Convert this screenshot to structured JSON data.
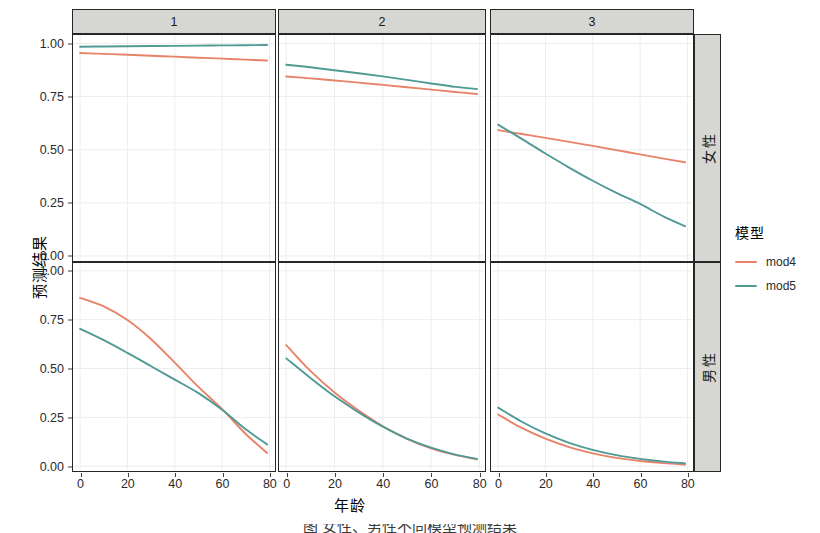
{
  "chart_data": {
    "type": "line",
    "title": "",
    "xlabel": "年龄",
    "ylabel": "预测结果",
    "xlim": [
      -3,
      82
    ],
    "ylim": [
      -0.02,
      1.04
    ],
    "xticks": [
      0,
      20,
      40,
      60,
      80
    ],
    "xtick_labels": [
      "0",
      "20",
      "40",
      "60",
      "80"
    ],
    "yticks": [
      0.0,
      0.25,
      0.5,
      0.75,
      1.0
    ],
    "ytick_labels": [
      "0.00",
      "0.25",
      "0.50",
      "0.75",
      "1.00"
    ],
    "grid": true,
    "legend_position": "right",
    "legend_title": "模型",
    "facet_cols": [
      "1",
      "2",
      "3"
    ],
    "facet_rows": [
      "女性",
      "男性"
    ],
    "series_names": [
      "mod4",
      "mod5"
    ],
    "series_colors": [
      "#e8836a",
      "#4f9a95"
    ],
    "panels": [
      {
        "row": "女性",
        "col": "1",
        "series": [
          {
            "name": "mod4",
            "color": "#e8836a",
            "x": [
              0,
              10,
              20,
              30,
              40,
              50,
              60,
              70,
              79
            ],
            "y": [
              0.955,
              0.951,
              0.947,
              0.942,
              0.938,
              0.933,
              0.929,
              0.924,
              0.92
            ]
          },
          {
            "name": "mod5",
            "color": "#4f9a95",
            "x": [
              0,
              10,
              20,
              30,
              40,
              50,
              60,
              70,
              79
            ],
            "y": [
              0.985,
              0.986,
              0.987,
              0.988,
              0.989,
              0.99,
              0.991,
              0.992,
              0.993
            ]
          }
        ]
      },
      {
        "row": "女性",
        "col": "2",
        "series": [
          {
            "name": "mod4",
            "color": "#e8836a",
            "x": [
              0,
              10,
              20,
              30,
              40,
              50,
              60,
              70,
              79
            ],
            "y": [
              0.845,
              0.836,
              0.826,
              0.816,
              0.805,
              0.794,
              0.783,
              0.772,
              0.762
            ]
          },
          {
            "name": "mod5",
            "color": "#4f9a95",
            "x": [
              0,
              10,
              20,
              30,
              40,
              50,
              60,
              70,
              79
            ],
            "y": [
              0.9,
              0.888,
              0.874,
              0.86,
              0.845,
              0.829,
              0.812,
              0.796,
              0.786
            ]
          }
        ]
      },
      {
        "row": "女性",
        "col": "3",
        "series": [
          {
            "name": "mod4",
            "color": "#e8836a",
            "x": [
              0,
              10,
              20,
              30,
              40,
              50,
              60,
              70,
              79
            ],
            "y": [
              0.592,
              0.574,
              0.556,
              0.537,
              0.518,
              0.498,
              0.478,
              0.458,
              0.441
            ]
          },
          {
            "name": "mod5",
            "color": "#4f9a95",
            "x": [
              0,
              10,
              20,
              30,
              40,
              50,
              60,
              70,
              79
            ],
            "y": [
              0.618,
              0.551,
              0.482,
              0.416,
              0.354,
              0.297,
              0.245,
              0.185,
              0.14
            ]
          }
        ]
      },
      {
        "row": "男性",
        "col": "1",
        "series": [
          {
            "name": "mod4",
            "color": "#e8836a",
            "x": [
              0,
              10,
              20,
              30,
              40,
              50,
              60,
              70,
              79
            ],
            "y": [
              0.862,
              0.818,
              0.748,
              0.65,
              0.53,
              0.406,
              0.292,
              0.165,
              0.068
            ]
          },
          {
            "name": "mod5",
            "color": "#4f9a95",
            "x": [
              0,
              10,
              20,
              30,
              40,
              50,
              60,
              70,
              79
            ],
            "y": [
              0.703,
              0.645,
              0.58,
              0.512,
              0.443,
              0.374,
              0.289,
              0.189,
              0.112
            ]
          }
        ]
      },
      {
        "row": "男性",
        "col": "2",
        "series": [
          {
            "name": "mod4",
            "color": "#e8836a",
            "x": [
              0,
              10,
              20,
              30,
              40,
              50,
              60,
              70,
              79
            ],
            "y": [
              0.62,
              0.488,
              0.378,
              0.285,
              0.205,
              0.14,
              0.092,
              0.058,
              0.035
            ]
          },
          {
            "name": "mod5",
            "color": "#4f9a95",
            "x": [
              0,
              10,
              20,
              30,
              40,
              50,
              60,
              70,
              79
            ],
            "y": [
              0.552,
              0.452,
              0.358,
              0.276,
              0.203,
              0.142,
              0.095,
              0.06,
              0.038
            ]
          }
        ]
      },
      {
        "row": "男性",
        "col": "3",
        "series": [
          {
            "name": "mod4",
            "color": "#e8836a",
            "x": [
              0,
              10,
              20,
              30,
              40,
              50,
              60,
              70,
              79
            ],
            "y": [
              0.265,
              0.196,
              0.141,
              0.098,
              0.066,
              0.043,
              0.027,
              0.016,
              0.009
            ]
          },
          {
            "name": "mod5",
            "color": "#4f9a95",
            "x": [
              0,
              10,
              20,
              30,
              40,
              50,
              60,
              70,
              79
            ],
            "y": [
              0.3,
              0.228,
              0.168,
              0.12,
              0.084,
              0.057,
              0.038,
              0.024,
              0.015
            ]
          }
        ]
      }
    ]
  },
  "legend": {
    "title": "模型",
    "items": [
      {
        "label": "mod4",
        "color": "#e8836a"
      },
      {
        "label": "mod5",
        "color": "#4f9a95"
      }
    ]
  },
  "axes": {
    "y_title": "预测结果",
    "x_title": "年龄"
  },
  "caption": {
    "text": "图    ⼥性、男性不同模型预测结果"
  },
  "colors": {
    "strip_background": "#d6d6d2",
    "panel_border": "#262626",
    "grid": "#ededed",
    "mod4": "#e8836a",
    "mod5": "#4f9a95"
  }
}
